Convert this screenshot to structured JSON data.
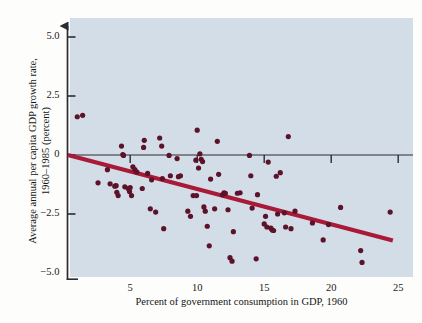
{
  "chart_data": {
    "type": "scatter",
    "title": "",
    "xlabel": "Percent of government consumption in GDP, 1960",
    "ylabel_line1": "Average annual per capita GDP growth rate,",
    "ylabel_line2": "1960–1985 (percent)",
    "xlim": [
      0,
      26.5
    ],
    "ylim": [
      -5.0,
      5.6
    ],
    "xticks": [
      5,
      10,
      15,
      20,
      25
    ],
    "xtick_labels": [
      "5",
      "10",
      "15",
      "20",
      "25"
    ],
    "yticks": [
      5.0,
      2.5,
      0,
      -2.5,
      -5.0
    ],
    "ytick_labels": [
      "5.0",
      "2.5",
      "0",
      "−2.5",
      "−5.0"
    ],
    "grid": false,
    "legend": null,
    "zero_line": 0,
    "colors": {
      "plot_background": "#d3dde7",
      "figure_background": "#fdfdfb",
      "point_color": "#5c1228",
      "trendline_color": "#a81a38",
      "axis_color": "#2b2b33"
    },
    "trendline": {
      "type": "linear-fit",
      "x_start": 0.35,
      "y_start": 0.0,
      "x_end": 24.6,
      "y_end": -3.62
    },
    "points": [
      {
        "x": 1.05,
        "y": 1.62
      },
      {
        "x": 1.45,
        "y": 1.68
      },
      {
        "x": 2.6,
        "y": -1.18
      },
      {
        "x": 3.3,
        "y": -0.62
      },
      {
        "x": 3.5,
        "y": -1.22
      },
      {
        "x": 3.85,
        "y": -1.32
      },
      {
        "x": 3.95,
        "y": -1.3
      },
      {
        "x": 4.0,
        "y": -1.58
      },
      {
        "x": 4.1,
        "y": -1.72
      },
      {
        "x": 4.35,
        "y": 0.38
      },
      {
        "x": 4.45,
        "y": 0.02
      },
      {
        "x": 4.5,
        "y": -0.02
      },
      {
        "x": 4.6,
        "y": -1.35
      },
      {
        "x": 4.85,
        "y": -1.42
      },
      {
        "x": 4.95,
        "y": -1.55
      },
      {
        "x": 5.0,
        "y": -1.38
      },
      {
        "x": 5.1,
        "y": -1.72
      },
      {
        "x": 5.2,
        "y": -0.5
      },
      {
        "x": 5.35,
        "y": -0.62
      },
      {
        "x": 5.5,
        "y": -0.72
      },
      {
        "x": 5.9,
        "y": -1.42
      },
      {
        "x": 6.0,
        "y": 0.32
      },
      {
        "x": 6.05,
        "y": 0.62
      },
      {
        "x": 6.3,
        "y": -0.78
      },
      {
        "x": 6.5,
        "y": -2.28
      },
      {
        "x": 6.6,
        "y": -1.05
      },
      {
        "x": 6.9,
        "y": -2.42
      },
      {
        "x": 7.2,
        "y": 0.72
      },
      {
        "x": 7.35,
        "y": 0.38
      },
      {
        "x": 7.4,
        "y": -1.0
      },
      {
        "x": 7.5,
        "y": -3.12
      },
      {
        "x": 7.9,
        "y": -0.02
      },
      {
        "x": 8.0,
        "y": -0.88
      },
      {
        "x": 8.5,
        "y": -0.15
      },
      {
        "x": 8.6,
        "y": -0.92
      },
      {
        "x": 8.75,
        "y": -0.88
      },
      {
        "x": 9.3,
        "y": -2.38
      },
      {
        "x": 9.5,
        "y": -2.6
      },
      {
        "x": 9.7,
        "y": -1.72
      },
      {
        "x": 9.9,
        "y": -0.22
      },
      {
        "x": 9.95,
        "y": -1.72
      },
      {
        "x": 10.0,
        "y": 1.05
      },
      {
        "x": 10.1,
        "y": -0.55
      },
      {
        "x": 10.2,
        "y": 0.05
      },
      {
        "x": 10.3,
        "y": -0.18
      },
      {
        "x": 10.4,
        "y": -0.28
      },
      {
        "x": 10.5,
        "y": -2.2
      },
      {
        "x": 10.6,
        "y": -2.38
      },
      {
        "x": 10.75,
        "y": -3.02
      },
      {
        "x": 10.9,
        "y": -3.85
      },
      {
        "x": 11.0,
        "y": -1.02
      },
      {
        "x": 11.3,
        "y": -2.28
      },
      {
        "x": 11.5,
        "y": 0.58
      },
      {
        "x": 11.6,
        "y": -0.82
      },
      {
        "x": 11.9,
        "y": -1.68
      },
      {
        "x": 12.0,
        "y": -1.6
      },
      {
        "x": 12.1,
        "y": -1.62
      },
      {
        "x": 12.3,
        "y": -2.32
      },
      {
        "x": 12.45,
        "y": -4.35
      },
      {
        "x": 12.6,
        "y": -4.5
      },
      {
        "x": 12.7,
        "y": -3.25
      },
      {
        "x": 13.0,
        "y": -1.62
      },
      {
        "x": 13.2,
        "y": -1.6
      },
      {
        "x": 13.9,
        "y": -0.02
      },
      {
        "x": 14.0,
        "y": -0.88
      },
      {
        "x": 14.1,
        "y": -2.25
      },
      {
        "x": 14.4,
        "y": -4.4
      },
      {
        "x": 14.5,
        "y": -1.68
      },
      {
        "x": 15.0,
        "y": -2.92
      },
      {
        "x": 15.1,
        "y": -2.6
      },
      {
        "x": 15.2,
        "y": -3.05
      },
      {
        "x": 15.3,
        "y": -0.3
      },
      {
        "x": 15.5,
        "y": -3.1
      },
      {
        "x": 15.6,
        "y": -3.18
      },
      {
        "x": 15.7,
        "y": -3.2
      },
      {
        "x": 15.9,
        "y": -0.9
      },
      {
        "x": 16.0,
        "y": -2.5
      },
      {
        "x": 16.2,
        "y": -0.75
      },
      {
        "x": 16.5,
        "y": -2.45
      },
      {
        "x": 16.6,
        "y": -3.05
      },
      {
        "x": 16.8,
        "y": 0.78
      },
      {
        "x": 17.0,
        "y": -3.12
      },
      {
        "x": 17.3,
        "y": -2.38
      },
      {
        "x": 18.6,
        "y": -2.88
      },
      {
        "x": 19.4,
        "y": -3.6
      },
      {
        "x": 19.8,
        "y": -2.95
      },
      {
        "x": 20.7,
        "y": -2.22
      },
      {
        "x": 22.2,
        "y": -4.05
      },
      {
        "x": 22.3,
        "y": -4.55
      },
      {
        "x": 24.4,
        "y": -2.42
      }
    ]
  }
}
